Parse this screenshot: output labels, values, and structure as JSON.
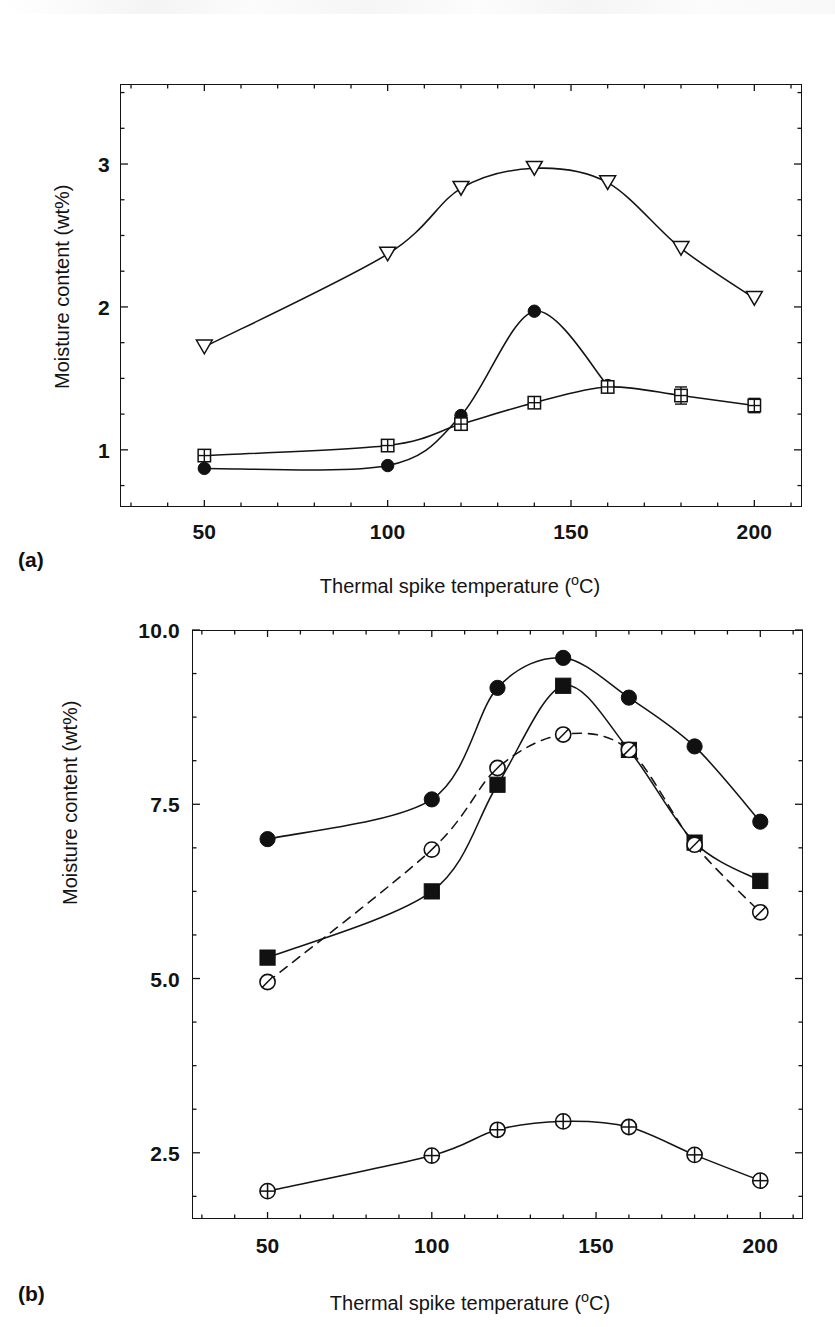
{
  "figure": {
    "panel_a_label": "(a)",
    "panel_b_label": "(b)",
    "axis_x_title": "Thermal spike temperature (°C)",
    "axis_y_title": "Moisture content (wt%)"
  },
  "chart_data": [
    {
      "id": "panel-a",
      "panel": "(a)",
      "type": "line",
      "title": "",
      "xlabel": "Thermal spike temperature (°C)",
      "ylabel": "Moisture content (wt%)",
      "xlim": [
        27,
        213
      ],
      "ylim": [
        0.6,
        3.56
      ],
      "xticks": [
        50,
        100,
        150,
        200
      ],
      "xtick_labels": [
        "50",
        "100",
        "150",
        "200"
      ],
      "yticks": [
        1,
        2,
        3
      ],
      "ytick_labels": [
        "1",
        "2",
        "3"
      ],
      "x": [
        50,
        100,
        120,
        140,
        160,
        180,
        200
      ],
      "grid": false,
      "legend": "none",
      "series": [
        {
          "name": "open-triangle-down",
          "marker": "triangle-down-open",
          "linestyle": "solid",
          "x": [
            50,
            100,
            120,
            140,
            160,
            200
          ],
          "values": [
            1.72,
            2.37,
            2.83,
            2.97,
            2.87,
            2.06
          ],
          "extra_x": [
            180
          ],
          "extra_values": [
            2.41
          ]
        },
        {
          "name": "filled-circle",
          "marker": "circle-filled",
          "linestyle": "solid",
          "x": [
            50,
            100,
            120,
            140,
            160
          ],
          "values": [
            0.87,
            0.89,
            1.24,
            1.97,
            1.45
          ]
        },
        {
          "name": "crossed-square-open",
          "marker": "square-crossed-open",
          "linestyle": "solid",
          "errorbars": true,
          "x": [
            50,
            100,
            120,
            140,
            160,
            180,
            200
          ],
          "values": [
            0.96,
            1.03,
            1.18,
            1.33,
            1.44,
            1.38,
            1.31
          ],
          "yerr": [
            0.0,
            0.0,
            0.0,
            0.0,
            0.0,
            0.06,
            0.05
          ]
        }
      ]
    },
    {
      "id": "panel-b",
      "panel": "(b)",
      "type": "line",
      "title": "",
      "xlabel": "Thermal spike temperature (°C)",
      "ylabel": "Moisture content (wt%)",
      "xlim": [
        27,
        213
      ],
      "ylim": [
        1.55,
        10.0
      ],
      "xticks": [
        50,
        100,
        150,
        200
      ],
      "xtick_labels": [
        "50",
        "100",
        "150",
        "200"
      ],
      "yticks": [
        2.5,
        5.0,
        7.5,
        10.0
      ],
      "ytick_labels": [
        "2.5",
        "5.0",
        "7.5",
        "10.0"
      ],
      "x": [
        50,
        100,
        120,
        140,
        160,
        180,
        200
      ],
      "grid": false,
      "legend": "none",
      "series": [
        {
          "name": "filled-circle",
          "marker": "circle-filled",
          "linestyle": "solid",
          "values": [
            7.0,
            7.57,
            9.17,
            9.6,
            9.03,
            8.33,
            7.25
          ]
        },
        {
          "name": "filled-square",
          "marker": "square-filled",
          "linestyle": "solid",
          "values": [
            5.3,
            6.25,
            7.78,
            9.2,
            8.28,
            6.95,
            6.4
          ]
        },
        {
          "name": "slashed-circle-open",
          "marker": "circle-slashed-open",
          "linestyle": "dashed",
          "values": [
            4.95,
            6.85,
            8.02,
            8.5,
            8.28,
            6.92,
            5.95
          ]
        },
        {
          "name": "plus-circle-open",
          "marker": "circle-plus-open",
          "linestyle": "solid",
          "values": [
            1.95,
            2.46,
            2.83,
            2.95,
            2.87,
            2.47,
            2.1
          ]
        }
      ]
    }
  ]
}
